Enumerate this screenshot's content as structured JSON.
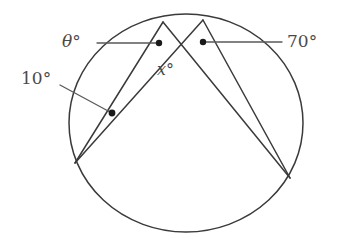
{
  "diagram": {
    "type": "geometry-circle-inscribed-angles",
    "background_color": "#ffffff",
    "stroke_color": "#3a3a3a",
    "leader_color": "#5a5a5a",
    "text_color": "#4a4a4a",
    "dot_color": "#1a1a1a",
    "canvas": {
      "width": 338,
      "height": 251
    },
    "circle": {
      "center_x": 186,
      "center_y": 123,
      "radius_x": 117,
      "radius_y": 109
    },
    "points": {
      "apex_left": {
        "x": 163,
        "y": 22,
        "name": "A"
      },
      "apex_right": {
        "x": 203,
        "y": 20,
        "name": "B"
      },
      "base_left": {
        "x": 75,
        "y": 163,
        "name": "L"
      },
      "base_right": {
        "x": 290,
        "y": 178,
        "name": "R"
      },
      "crossing": {
        "x": 183,
        "y": 47,
        "name": "P"
      }
    },
    "chords": [
      {
        "name": "apex-left-to-base-left",
        "x1": 163,
        "y1": 22,
        "x2": 75,
        "y2": 163
      },
      {
        "name": "apex-left-to-base-right",
        "x1": 163,
        "y1": 22,
        "x2": 290,
        "y2": 178
      },
      {
        "name": "apex-right-to-base-left",
        "x1": 203,
        "y1": 20,
        "x2": 75,
        "y2": 163
      },
      {
        "name": "apex-right-to-base-right",
        "x1": 203,
        "y1": 20,
        "x2": 290,
        "y2": 178
      }
    ],
    "markers": [
      {
        "name": "theta-angle-dot",
        "x": 159,
        "y": 43
      },
      {
        "name": "seventy-angle-dot",
        "x": 203,
        "y": 42
      },
      {
        "name": "ten-angle-dot",
        "x": 112,
        "y": 113
      }
    ],
    "leaders": [
      {
        "name": "theta-leader-line",
        "x1": 97,
        "y1": 43,
        "x2": 157,
        "y2": 43
      },
      {
        "name": "seventy-leader-line",
        "x1": 205,
        "y1": 42,
        "x2": 282,
        "y2": 42
      },
      {
        "name": "ten-leader-line",
        "x1": 60,
        "y1": 85,
        "x2": 110,
        "y2": 112
      }
    ],
    "labels": {
      "theta": {
        "text": "θ°",
        "x": 62,
        "y": 33
      },
      "seventy": {
        "text": "70°",
        "x": 287,
        "y": 33
      },
      "ten": {
        "text": "10°",
        "x": 21,
        "y": 70
      },
      "x_angle": {
        "text_symbol": "x",
        "text_degree": "°",
        "x": 157,
        "y": 62
      }
    }
  }
}
